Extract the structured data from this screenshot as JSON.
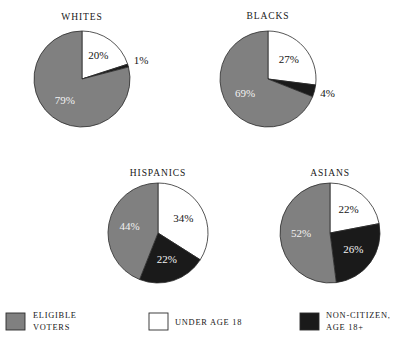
{
  "chart_data": [
    {
      "type": "pie",
      "title": "WHITES",
      "categories": [
        "ELIGIBLE VOTERS",
        "UNDER AGE 18",
        "NON-CITIZEN, AGE 18+"
      ],
      "values": [
        79,
        20,
        1
      ],
      "labels": [
        "79%",
        "20%",
        "1%"
      ],
      "colors": [
        "#808080",
        "#ffffff",
        "#1a1a1a"
      ],
      "units": "percent",
      "legend_position": "bottom",
      "grid": false
    },
    {
      "type": "pie",
      "title": "BLACKS",
      "categories": [
        "ELIGIBLE VOTERS",
        "UNDER AGE 18",
        "NON-CITIZEN, AGE 18+"
      ],
      "values": [
        69,
        27,
        4
      ],
      "labels": [
        "69%",
        "27%",
        "4%"
      ],
      "colors": [
        "#808080",
        "#ffffff",
        "#1a1a1a"
      ],
      "units": "percent",
      "legend_position": "bottom",
      "grid": false
    },
    {
      "type": "pie",
      "title": "HISPANICS",
      "categories": [
        "ELIGIBLE VOTERS",
        "UNDER AGE 18",
        "NON-CITIZEN, AGE 18+"
      ],
      "values": [
        44,
        34,
        22
      ],
      "labels": [
        "44%",
        "34%",
        "22%"
      ],
      "colors": [
        "#808080",
        "#ffffff",
        "#1a1a1a"
      ],
      "units": "percent",
      "legend_position": "bottom",
      "grid": false
    },
    {
      "type": "pie",
      "title": "ASIANS",
      "categories": [
        "ELIGIBLE VOTERS",
        "UNDER AGE 18",
        "NON-CITIZEN, AGE 18+"
      ],
      "values": [
        52,
        22,
        26
      ],
      "labels": [
        "52%",
        "22%",
        "26%"
      ],
      "colors": [
        "#808080",
        "#ffffff",
        "#1a1a1a"
      ],
      "units": "percent",
      "legend_position": "bottom",
      "grid": false
    }
  ],
  "charts": {
    "whites": {
      "title": "WHITES",
      "slices": [
        {
          "name": "under-age-18",
          "label": "20%",
          "value": 20,
          "color": "#ffffff",
          "label_fill": "on-light",
          "inside": true
        },
        {
          "name": "non-citizen",
          "label": "1%",
          "value": 1,
          "color": "#1a1a1a",
          "label_fill": "outside",
          "inside": false
        },
        {
          "name": "eligible-voters",
          "label": "79%",
          "value": 79,
          "color": "#808080",
          "label_fill": "on-dark",
          "inside": true
        }
      ]
    },
    "blacks": {
      "title": "BLACKS",
      "slices": [
        {
          "name": "under-age-18",
          "label": "27%",
          "value": 27,
          "color": "#ffffff",
          "label_fill": "on-light",
          "inside": true
        },
        {
          "name": "non-citizen",
          "label": "4%",
          "value": 4,
          "color": "#1a1a1a",
          "label_fill": "outside",
          "inside": false
        },
        {
          "name": "eligible-voters",
          "label": "69%",
          "value": 69,
          "color": "#808080",
          "label_fill": "on-dark",
          "inside": true
        }
      ]
    },
    "hispanics": {
      "title": "HISPANICS",
      "slices": [
        {
          "name": "under-age-18",
          "label": "34%",
          "value": 34,
          "color": "#ffffff",
          "label_fill": "on-light",
          "inside": true
        },
        {
          "name": "non-citizen",
          "label": "22%",
          "value": 22,
          "color": "#1a1a1a",
          "label_fill": "on-dark",
          "inside": true
        },
        {
          "name": "eligible-voters",
          "label": "44%",
          "value": 44,
          "color": "#808080",
          "label_fill": "on-dark",
          "inside": true
        }
      ]
    },
    "asians": {
      "title": "ASIANS",
      "slices": [
        {
          "name": "under-age-18",
          "label": "22%",
          "value": 22,
          "color": "#ffffff",
          "label_fill": "on-light",
          "inside": true
        },
        {
          "name": "non-citizen",
          "label": "26%",
          "value": 26,
          "color": "#1a1a1a",
          "label_fill": "on-dark",
          "inside": true
        },
        {
          "name": "eligible-voters",
          "label": "52%",
          "value": 52,
          "color": "#808080",
          "label_fill": "on-dark",
          "inside": true
        }
      ]
    }
  },
  "legend": {
    "items": [
      {
        "name": "eligible-voters",
        "label_line1": "ELIGIBLE",
        "label_line2": "VOTERS",
        "color": "#808080"
      },
      {
        "name": "under-age-18",
        "label_line1": "UNDER AGE 18",
        "label_line2": "",
        "color": "#ffffff"
      },
      {
        "name": "non-citizen",
        "label_line1": "NON-CITIZEN,",
        "label_line2": "AGE 18+",
        "color": "#1a1a1a"
      }
    ]
  },
  "colors": {
    "eligible_voters": "#808080",
    "under_age_18": "#ffffff",
    "non_citizen": "#1a1a1a",
    "outline": "#2b2b2b",
    "text": "#171717"
  }
}
